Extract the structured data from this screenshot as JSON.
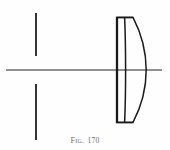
{
  "figure": {
    "caption_label": "Fig.",
    "caption_number": "170",
    "caption_full": "FIG. 170",
    "type": "optical-ray-diagram",
    "background_color": "#fefefe",
    "ink_color": "#1a1a1a",
    "axis_color": "#6b6b6b",
    "caption_color": "#6d6d6d"
  },
  "elements": {
    "optical_axis": {
      "name": "optical axis",
      "x1": 6,
      "y1": 70,
      "x2": 162,
      "y2": 70,
      "stroke_width": 1.3,
      "color": "#6b6b6b"
    },
    "aperture_stop": {
      "name": "aperture stop",
      "upper_blade": {
        "x": 36,
        "y1": 13,
        "y2": 56
      },
      "lower_blade": {
        "x": 36,
        "y1": 84,
        "y2": 140
      },
      "stroke_width": 1.9,
      "color": "#2b2b2b"
    },
    "lens": {
      "name": "cemented doublet",
      "top_y": 17,
      "bottom_y": 122,
      "front_flat_x": 117,
      "cement_surface_x": 124,
      "rear_vertex_x": 146,
      "rear_curve_bulge": "right",
      "stroke_width": 1.5,
      "color": "#1a1a1a",
      "surfaces": [
        {
          "id": "S1",
          "shape": "near-flat",
          "label": "front surface"
        },
        {
          "id": "S2",
          "shape": "near-flat",
          "label": "cemented interface"
        },
        {
          "id": "S3",
          "shape": "convex",
          "label": "rear surface"
        }
      ]
    }
  }
}
